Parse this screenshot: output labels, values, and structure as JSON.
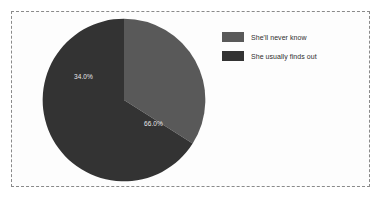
{
  "figure": {
    "frame_border_color": "#8a8a8a",
    "background": "#fdfdfd"
  },
  "legend": {
    "position": "right",
    "items": [
      {
        "label": "She'll never know",
        "color": "#595959"
      },
      {
        "label": "She usually finds out",
        "color": "#333333"
      }
    ]
  },
  "chart_data": {
    "type": "pie",
    "title": "",
    "subtitle": "",
    "xlabel": "",
    "ylabel": "",
    "grid": false,
    "legend_position": "right",
    "start_angle_deg": 90,
    "direction": "clockwise",
    "categories": [
      "She'll never know",
      "She usually finds out"
    ],
    "values": [
      34.0,
      66.0
    ],
    "value_unit": "percent",
    "colors": [
      "#595959",
      "#333333"
    ],
    "labels": [
      "34.0%",
      "66.0%"
    ],
    "label_color": "#e8e8e8",
    "slices": [
      {
        "name": "She'll never know",
        "value": 34.0,
        "label": "34.0%",
        "color": "#595959"
      },
      {
        "name": "She usually finds out",
        "value": 66.0,
        "label": "66.0%",
        "color": "#333333"
      }
    ]
  }
}
